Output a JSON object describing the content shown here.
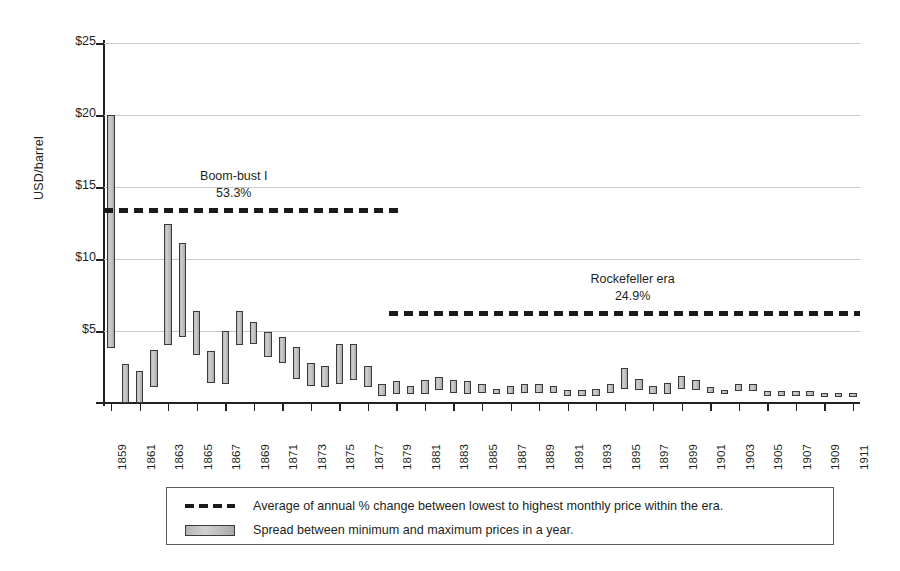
{
  "chart_data": {
    "type": "bar",
    "title": "",
    "subtitle": "",
    "xlabel": "",
    "ylabel": "USD/barrel",
    "ylim": [
      0,
      25
    ],
    "xlim": [
      1859,
      1911
    ],
    "grid": true,
    "legend_position": "bottom",
    "y_tick_labels": [
      "$25",
      "$20",
      "$15",
      "$10",
      "$5"
    ],
    "y_tick_values": [
      25,
      20,
      15,
      10,
      5
    ],
    "x_tick_labels": [
      "1859",
      "1861",
      "1863",
      "1865",
      "1867",
      "1869",
      "1871",
      "1873",
      "1875",
      "1877",
      "1879",
      "1881",
      "1883",
      "1885",
      "1887",
      "1889",
      "1891",
      "1893",
      "1895",
      "1897",
      "1899",
      "1901",
      "1903",
      "1905",
      "1907",
      "1909",
      "1911"
    ],
    "series": [
      {
        "name": "Spread between minimum and maximum prices in a year.",
        "type": "range-bar",
        "points": [
          {
            "year": 1859,
            "min": 3.8,
            "max": 20.0
          },
          {
            "year": 1860,
            "min": 0.0,
            "max": 2.7
          },
          {
            "year": 1861,
            "min": 0.0,
            "max": 2.2
          },
          {
            "year": 1862,
            "min": 1.1,
            "max": 3.7
          },
          {
            "year": 1863,
            "min": 4.0,
            "max": 12.4
          },
          {
            "year": 1864,
            "min": 4.6,
            "max": 11.1
          },
          {
            "year": 1865,
            "min": 3.3,
            "max": 6.4
          },
          {
            "year": 1866,
            "min": 1.4,
            "max": 3.6
          },
          {
            "year": 1867,
            "min": 1.3,
            "max": 5.0
          },
          {
            "year": 1868,
            "min": 4.0,
            "max": 6.4
          },
          {
            "year": 1869,
            "min": 4.1,
            "max": 5.6
          },
          {
            "year": 1870,
            "min": 3.2,
            "max": 4.9
          },
          {
            "year": 1871,
            "min": 2.8,
            "max": 4.6
          },
          {
            "year": 1872,
            "min": 1.7,
            "max": 3.9
          },
          {
            "year": 1873,
            "min": 1.2,
            "max": 2.8
          },
          {
            "year": 1874,
            "min": 1.1,
            "max": 2.6
          },
          {
            "year": 1875,
            "min": 1.3,
            "max": 4.1
          },
          {
            "year": 1876,
            "min": 1.6,
            "max": 4.1
          },
          {
            "year": 1877,
            "min": 1.1,
            "max": 2.6
          },
          {
            "year": 1878,
            "min": 0.5,
            "max": 1.3
          },
          {
            "year": 1879,
            "min": 0.6,
            "max": 1.5
          },
          {
            "year": 1880,
            "min": 0.6,
            "max": 1.2
          },
          {
            "year": 1881,
            "min": 0.6,
            "max": 1.6
          },
          {
            "year": 1882,
            "min": 0.9,
            "max": 1.8
          },
          {
            "year": 1883,
            "min": 0.7,
            "max": 1.6
          },
          {
            "year": 1884,
            "min": 0.6,
            "max": 1.5
          },
          {
            "year": 1885,
            "min": 0.7,
            "max": 1.3
          },
          {
            "year": 1886,
            "min": 0.6,
            "max": 1.0
          },
          {
            "year": 1887,
            "min": 0.6,
            "max": 1.2
          },
          {
            "year": 1888,
            "min": 0.7,
            "max": 1.3
          },
          {
            "year": 1889,
            "min": 0.7,
            "max": 1.3
          },
          {
            "year": 1890,
            "min": 0.7,
            "max": 1.2
          },
          {
            "year": 1891,
            "min": 0.5,
            "max": 0.9
          },
          {
            "year": 1892,
            "min": 0.5,
            "max": 0.9
          },
          {
            "year": 1893,
            "min": 0.5,
            "max": 1.0
          },
          {
            "year": 1894,
            "min": 0.7,
            "max": 1.3
          },
          {
            "year": 1895,
            "min": 1.0,
            "max": 2.4
          },
          {
            "year": 1896,
            "min": 0.9,
            "max": 1.7
          },
          {
            "year": 1897,
            "min": 0.6,
            "max": 1.2
          },
          {
            "year": 1898,
            "min": 0.6,
            "max": 1.4
          },
          {
            "year": 1899,
            "min": 1.0,
            "max": 1.9
          },
          {
            "year": 1900,
            "min": 0.9,
            "max": 1.6
          },
          {
            "year": 1901,
            "min": 0.7,
            "max": 1.1
          },
          {
            "year": 1902,
            "min": 0.6,
            "max": 0.9
          },
          {
            "year": 1903,
            "min": 0.8,
            "max": 1.3
          },
          {
            "year": 1904,
            "min": 0.8,
            "max": 1.3
          },
          {
            "year": 1905,
            "min": 0.5,
            "max": 0.8
          },
          {
            "year": 1906,
            "min": 0.5,
            "max": 0.8
          },
          {
            "year": 1907,
            "min": 0.5,
            "max": 0.8
          },
          {
            "year": 1908,
            "min": 0.5,
            "max": 0.8
          },
          {
            "year": 1909,
            "min": 0.4,
            "max": 0.7
          },
          {
            "year": 1910,
            "min": 0.4,
            "max": 0.7
          },
          {
            "year": 1911,
            "min": 0.4,
            "max": 0.7
          }
        ]
      }
    ],
    "annotations": [
      {
        "id": "boom-bust-1",
        "name": "Boom-bust I",
        "percent": "53.3%",
        "level": 13.4,
        "start_year": 1859,
        "end_year": 1879
      },
      {
        "id": "rockefeller-era",
        "name": "Rockefeller era",
        "percent": "24.9%",
        "level": 6.25,
        "start_year": 1879,
        "end_year": 1911
      }
    ]
  },
  "legend": {
    "items": [
      {
        "key": "dashed-line",
        "label": "Average of annual % change between lowest to highest monthly price within the era."
      },
      {
        "key": "gray-bar",
        "label": "Spread between minimum and maximum prices in a year."
      }
    ]
  },
  "colors": {
    "axis": "#231f20",
    "grid": "#c9c9c9",
    "bar_fill": "#c4c4c4",
    "bar_stroke": "#3a3a3a",
    "dash": "#1a1a1a",
    "text": "#231f20",
    "background": "#ffffff"
  }
}
